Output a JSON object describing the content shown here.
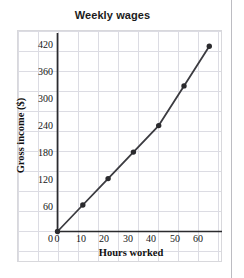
{
  "chart_data": {
    "type": "line",
    "title": "Weekly wages",
    "xlabel": "Hours worked",
    "ylabel": "Gross income ($)",
    "x": [
      0,
      10,
      20,
      30,
      40,
      50,
      60
    ],
    "values": [
      0,
      60,
      120,
      180,
      240,
      330,
      420
    ],
    "series": [
      {
        "name": "Gross income",
        "values": [
          0,
          60,
          120,
          180,
          240,
          330,
          420
        ]
      }
    ],
    "xlim": [
      0,
      65
    ],
    "ylim": [
      0,
      450
    ],
    "xticks": [
      0,
      10,
      20,
      30,
      40,
      50,
      60
    ],
    "yticks": [
      0,
      60,
      120,
      180,
      240,
      300,
      360,
      420
    ],
    "xtick_labels": [
      "0",
      "10",
      "20",
      "30",
      "40",
      "50",
      "60"
    ],
    "ytick_labels": [
      "0",
      "60",
      "120",
      "180",
      "240",
      "300",
      "360",
      "420"
    ],
    "x_minor_step": 5,
    "y_minor_step": 30,
    "grid": true,
    "legend": false,
    "marker": "circle",
    "line_color": "#3b3b40",
    "marker_color": "#2b2b2e",
    "grid_color": "#d9d9e0",
    "axis_color": "#2b2b2e"
  }
}
